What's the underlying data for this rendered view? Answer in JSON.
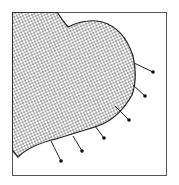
{
  "diagram": {
    "type": "stippled-shape-with-pins",
    "frame": {
      "x": 12,
      "y": 12,
      "width": 154,
      "height": 163,
      "stroke": "#555555"
    },
    "shape": {
      "name": "heart-lobe",
      "fill_pattern": "stipple-dots",
      "stroke": "#222222",
      "dot_color": "#1a1a1a"
    },
    "pins": [
      {
        "x1": 134,
        "y1": 63,
        "x2": 153,
        "y2": 72
      },
      {
        "x1": 133,
        "y1": 85,
        "x2": 145,
        "y2": 96
      },
      {
        "x1": 115,
        "y1": 106,
        "x2": 129,
        "y2": 120
      },
      {
        "x1": 95,
        "y1": 126,
        "x2": 104,
        "y2": 138
      },
      {
        "x1": 73,
        "y1": 136,
        "x2": 82,
        "y2": 151
      },
      {
        "x1": 51,
        "y1": 141,
        "x2": 61,
        "y2": 161
      }
    ]
  }
}
